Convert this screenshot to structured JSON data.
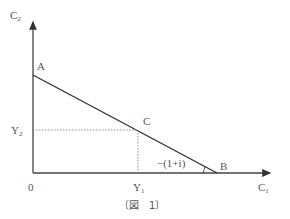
{
  "figure": {
    "caption": "〔図　1〕",
    "axes": {
      "y_label": "C",
      "y_label_sub": "2",
      "x_label": "C",
      "x_label_sub": "1",
      "origin_label": "0"
    },
    "points": {
      "A": "A",
      "B": "B",
      "C": "C"
    },
    "ticks": {
      "y2_label": "Y",
      "y2_sub": "2",
      "y1_label": "Y",
      "y1_sub": "1"
    },
    "slope_label": "−(1+i)",
    "colors": {
      "line": "#333333",
      "text": "#555555",
      "dotted": "#888888"
    }
  }
}
